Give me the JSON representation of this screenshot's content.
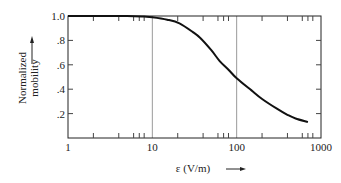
{
  "chart_data": {
    "type": "line",
    "title": "",
    "xlabel": "ε (V/m)",
    "ylabel": "Normalized mobility",
    "xscale": "log",
    "xlim": [
      1,
      1000
    ],
    "ylim": [
      0,
      1.0
    ],
    "xticks": [
      1,
      10,
      100,
      1000
    ],
    "xtick_labels": [
      "1",
      "10",
      "100",
      "1000"
    ],
    "yticks": [
      0.2,
      0.4,
      0.6,
      0.8,
      1.0
    ],
    "ytick_labels": [
      ".2",
      ".4",
      ".6",
      ".8",
      "1.0"
    ],
    "grid": "vertical lines at 10 and 100",
    "legend": "none",
    "series": [
      {
        "name": "Normalized mobility",
        "x": [
          1,
          2,
          5,
          8,
          10,
          15,
          21,
          30,
          37,
          50,
          63,
          80,
          100,
          150,
          200,
          300,
          400,
          500,
          700
        ],
        "y": [
          1.0,
          1.0,
          1.0,
          0.995,
          0.99,
          0.97,
          0.94,
          0.87,
          0.82,
          0.72,
          0.63,
          0.56,
          0.49,
          0.39,
          0.32,
          0.24,
          0.19,
          0.16,
          0.13
        ]
      }
    ],
    "color": "#111111"
  }
}
